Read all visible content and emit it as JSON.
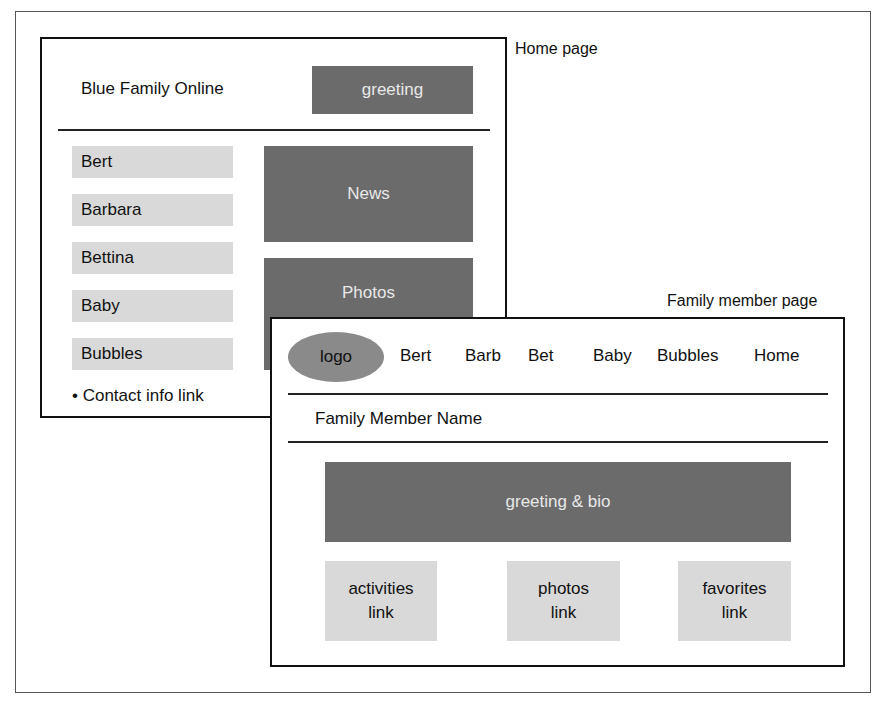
{
  "captions": {
    "home": "Home page",
    "member": "Family member page"
  },
  "home_page": {
    "site_title": "Blue Family Online",
    "greeting": "greeting",
    "members": [
      "Bert",
      "Barbara",
      "Bettina",
      "Baby",
      "Bubbles"
    ],
    "news": "News",
    "photos": "Photos",
    "contact_link": "• Contact info link"
  },
  "member_page": {
    "logo": "logo",
    "nav": [
      "Bert",
      "Barb",
      "Bet",
      "Baby",
      "Bubbles",
      "Home"
    ],
    "member_name": "Family Member Name",
    "greeting_bio": "greeting & bio",
    "links": [
      {
        "line1": "activities",
        "line2": "link"
      },
      {
        "line1": "photos",
        "line2": "link"
      },
      {
        "line1": "favorites",
        "line2": "link"
      }
    ]
  },
  "colors": {
    "dark_block": "#6b6b6b",
    "light_block": "#d9d9d9",
    "logo_oval": "#8a8a8a"
  }
}
